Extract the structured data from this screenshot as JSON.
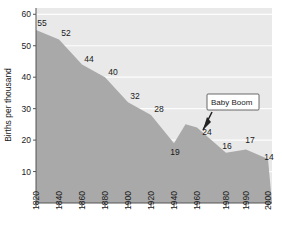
{
  "chart_data": {
    "type": "area",
    "title": "",
    "xlabel": "",
    "ylabel": "Births per thousand",
    "x": [
      1820,
      1840,
      1860,
      1880,
      1900,
      1920,
      1940,
      1950,
      1960,
      1980,
      1990,
      2000
    ],
    "values": [
      55,
      52,
      44,
      40,
      32,
      28,
      19,
      25,
      24,
      16,
      17,
      14
    ],
    "point_labels": [
      "55",
      "52",
      "44",
      "40",
      "32",
      "28",
      "19",
      "",
      "24",
      "16",
      "17",
      "14"
    ],
    "xticks": [
      "1820",
      "1840",
      "1860",
      "1880",
      "1900",
      "1920",
      "1940",
      "1960",
      "1980",
      "1990",
      "2000"
    ],
    "yticks": [
      "10",
      "20",
      "30",
      "40",
      "50",
      "60"
    ],
    "ylim": [
      0,
      62
    ],
    "xlim": [
      1820,
      2000
    ],
    "grid": true,
    "legend": "none",
    "annotations": [
      {
        "text": "Baby Boom",
        "points_to_year": 1950,
        "points_to_value": 25
      }
    ],
    "colors": {
      "area_fill": "#a9a9a9",
      "plot_background": "#e9e9e9",
      "gridline": "#fdfdfd",
      "axis": "#555555",
      "text": "#1a1a1a",
      "callout_background": "#ffffff",
      "callout_border": "#444444"
    }
  }
}
